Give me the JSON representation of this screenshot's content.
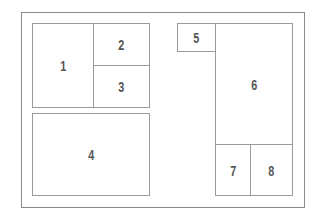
{
  "diagram": {
    "type": "layout-grid",
    "colors": {
      "line": "#9a9a9a",
      "frame": "#8a8a8a",
      "label": "#555555"
    },
    "cells": [
      {
        "label": "1"
      },
      {
        "label": "2"
      },
      {
        "label": "3"
      },
      {
        "label": "4"
      },
      {
        "label": "5"
      },
      {
        "label": "6"
      },
      {
        "label": "7"
      },
      {
        "label": "8"
      }
    ]
  }
}
